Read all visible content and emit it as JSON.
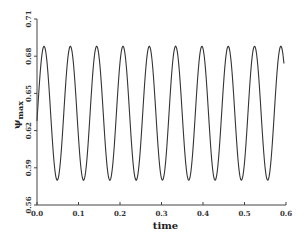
{
  "chart_data": {
    "type": "line",
    "title": "",
    "xlabel": "time",
    "ylabel": "ψ_max",
    "ylabel_main": "ψ",
    "ylabel_sub": "max",
    "xlim": [
      0.0,
      0.6
    ],
    "ylim": [
      0.56,
      0.71
    ],
    "x_ticks": [
      "0.0",
      "0.1",
      "0.2",
      "0.3",
      "0.4",
      "0.5",
      "0.6"
    ],
    "y_ticks": [
      "0.56",
      "0.59",
      "0.62",
      "0.65",
      "0.68",
      "0.71"
    ],
    "grid": false,
    "legend": null,
    "series": [
      {
        "name": "ψ_max(t)",
        "description": "Periodic oscillation, ~10 peaks over t in [0, 0.6]",
        "midline": 0.634,
        "amplitude": 0.054,
        "period": 0.0634,
        "start_value": 0.645,
        "peak_value": 0.688,
        "trough_value": 0.58,
        "peaks_t": [
          0.017,
          0.08,
          0.142,
          0.205,
          0.267,
          0.33,
          0.393,
          0.458,
          0.523,
          0.588
        ],
        "troughs_t": [
          0.051,
          0.113,
          0.176,
          0.239,
          0.301,
          0.364,
          0.427,
          0.49,
          0.554
        ],
        "t_end": 0.595
      }
    ],
    "line_color": "#333333"
  }
}
